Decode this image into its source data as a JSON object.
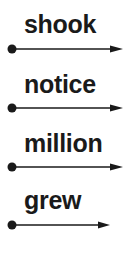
{
  "items": [
    {
      "word": "shook",
      "arrow_end": 123
    },
    {
      "word": "notice",
      "arrow_end": 123
    },
    {
      "word": "million",
      "arrow_end": 123
    },
    {
      "word": "grew",
      "arrow_end": 110
    }
  ],
  "colors": {
    "ink": "#1a1a1a",
    "background": "#ffffff"
  }
}
